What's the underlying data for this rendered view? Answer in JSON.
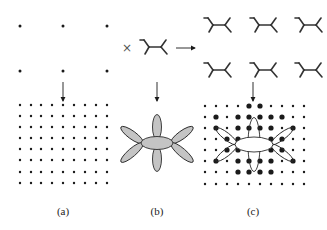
{
  "colors": {
    "ink": "#1a1a1a",
    "lobe_fill": "#c4c4c4",
    "lobe_stroke": "#2a2a2a",
    "background": "#ffffff"
  },
  "panels": [
    {
      "id": "a",
      "label": "(a)",
      "label_x": 63,
      "sparse_lattice": {
        "xs": [
          20,
          63,
          107
        ],
        "ys": [
          26,
          71
        ],
        "r": 1.5
      },
      "arrow": {
        "x": 63,
        "y1": 82,
        "y2": 101
      },
      "dense_lattice": {
        "xs": [
          20,
          31,
          41,
          52,
          63,
          74,
          85,
          96,
          107
        ],
        "ys": [
          105,
          116,
          127,
          138,
          149,
          160,
          172,
          183
        ],
        "r": 1.2
      }
    },
    {
      "id": "b",
      "label": "(b)",
      "label_x": 157,
      "cross_symbol": {
        "x": 127,
        "y": 48,
        "glyph": "×"
      },
      "basis_molecule": {
        "cx": 155,
        "cy": 47
      },
      "h_arrow": {
        "x1": 176,
        "x2": 195,
        "y": 48
      },
      "arrow": {
        "x": 157,
        "y1": 82,
        "y2": 101
      },
      "orbital": {
        "cx": 157,
        "cy": 143,
        "center_ellipse": {
          "rx": 16,
          "ry": 6.5
        },
        "vertical_lobe": {
          "offset": 16,
          "rx": 4.5,
          "ry": 12.5
        },
        "diagonal_lobes": [
          {
            "ex": 121,
            "ey": 127
          },
          {
            "ex": 193,
            "ey": 127
          },
          {
            "ex": 121,
            "ey": 162
          },
          {
            "ex": 193,
            "ey": 162
          }
        ]
      }
    },
    {
      "id": "c",
      "label": "(c)",
      "label_x": 253,
      "molecule_lattice": {
        "xs": [
          219,
          265,
          310
        ],
        "ys": [
          25,
          70
        ]
      },
      "arrow": {
        "x": 253,
        "y1": 82,
        "y2": 101
      },
      "dense_lattice": {
        "xs": [
          205,
          216,
          227,
          238,
          249,
          260,
          271,
          282,
          293,
          304
        ],
        "ys": [
          106,
          117,
          128,
          139,
          150,
          161,
          172,
          184
        ],
        "r": 1.2,
        "big_r": 2.6,
        "big_points": [
          [
            249,
            106
          ],
          [
            260,
            106
          ],
          [
            216,
            117
          ],
          [
            238,
            117
          ],
          [
            249,
            117
          ],
          [
            260,
            117
          ],
          [
            271,
            117
          ],
          [
            282,
            117
          ],
          [
            216,
            128
          ],
          [
            238,
            128
          ],
          [
            249,
            128
          ],
          [
            260,
            128
          ],
          [
            271,
            128
          ],
          [
            293,
            128
          ],
          [
            227,
            139
          ],
          [
            238,
            139
          ],
          [
            271,
            139
          ],
          [
            282,
            139
          ],
          [
            238,
            150
          ],
          [
            271,
            150
          ],
          [
            227,
            150
          ],
          [
            282,
            150
          ],
          [
            216,
            161
          ],
          [
            238,
            161
          ],
          [
            249,
            161
          ],
          [
            260,
            161
          ],
          [
            271,
            161
          ],
          [
            293,
            161
          ],
          [
            249,
            172
          ],
          [
            260,
            172
          ],
          [
            238,
            172
          ],
          [
            271,
            172
          ]
        ]
      },
      "orbital_outline": {
        "cx": 254,
        "cy": 144.5,
        "center_ellipse": {
          "rx": 19,
          "ry": 7.5
        },
        "vertical_loop": {
          "rx": 6,
          "ry": 27
        },
        "diagonal_lobes": [
          {
            "ex": 216,
            "ey": 128
          },
          {
            "ex": 293,
            "ey": 128
          },
          {
            "ex": 216,
            "ey": 161
          },
          {
            "ex": 293,
            "ey": 161
          }
        ]
      }
    }
  ]
}
